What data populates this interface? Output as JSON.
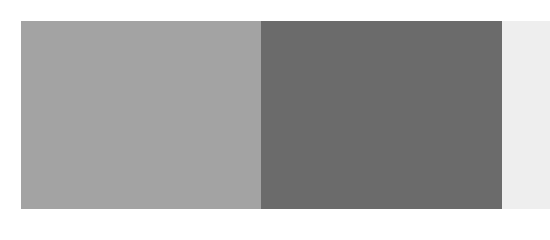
{
  "swatches": [
    {
      "name": "medium-gray",
      "color": "#a3a3a3"
    },
    {
      "name": "dark-gray",
      "color": "#6b6b6b"
    },
    {
      "name": "light-gray",
      "color": "#eeeeee"
    }
  ]
}
